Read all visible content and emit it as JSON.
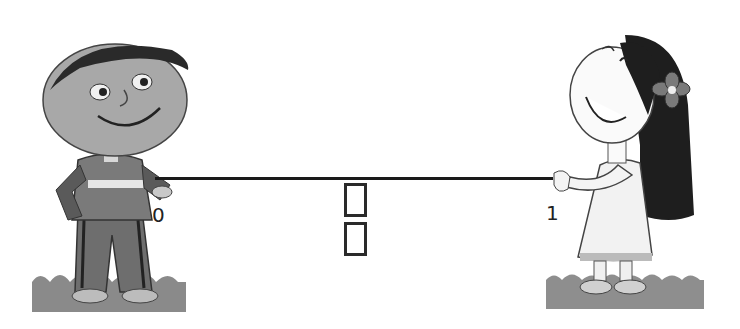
{
  "diagram": {
    "number_line": {
      "start_label": "0",
      "end_label": "1",
      "line_color": "#1a1a1a"
    },
    "fraction_placeholder": {
      "numerator_box": "",
      "denominator_box": ""
    },
    "characters": [
      {
        "name": "boy",
        "position": "left",
        "holds": "start of line"
      },
      {
        "name": "girl",
        "position": "right",
        "holds": "end of line"
      }
    ]
  }
}
